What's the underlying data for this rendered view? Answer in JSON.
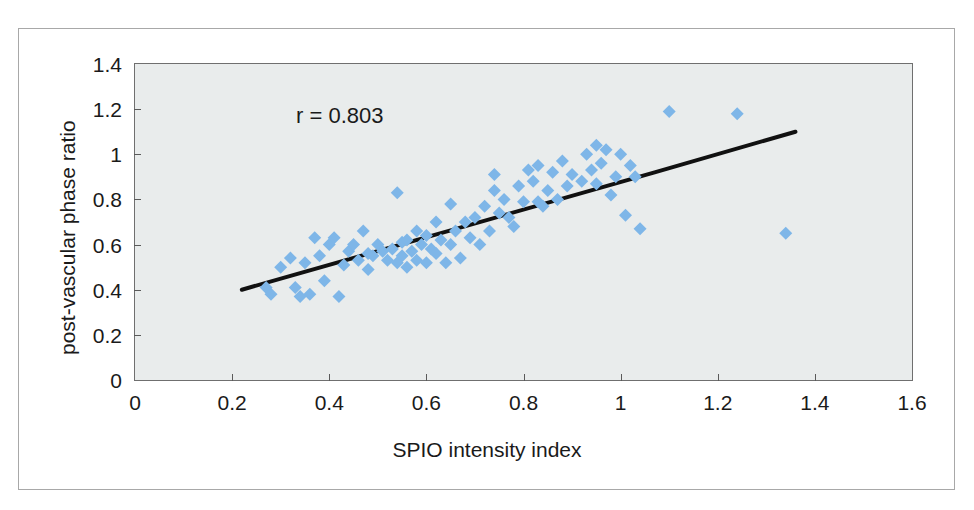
{
  "chart_data": {
    "type": "scatter",
    "title": "",
    "xlabel": "SPIO intensity index",
    "ylabel": "post-vascular phase ratio",
    "xlim": [
      0,
      1.6
    ],
    "ylim": [
      0,
      1.4
    ],
    "xticks": [
      "0",
      "0.2",
      "0.4",
      "0.6",
      "0.8",
      "1",
      "1.2",
      "1.4",
      "1.6"
    ],
    "xtick_values": [
      0,
      0.2,
      0.4,
      0.6,
      0.8,
      1.0,
      1.2,
      1.4,
      1.6
    ],
    "yticks": [
      "0",
      "0.2",
      "0.4",
      "0.6",
      "0.8",
      "1",
      "1.2",
      "1.4"
    ],
    "ytick_values": [
      0,
      0.2,
      0.4,
      0.6,
      0.8,
      1.0,
      1.2,
      1.4
    ],
    "grid": false,
    "legend": null,
    "annotations": [
      {
        "text": "r = 0.803",
        "x": 0.34,
        "y": 1.17
      }
    ],
    "marker": {
      "shape": "diamond",
      "color": "#7EB6E8",
      "size": 13
    },
    "series": [
      {
        "name": "samples",
        "points": [
          [
            0.27,
            0.41
          ],
          [
            0.28,
            0.38
          ],
          [
            0.3,
            0.5
          ],
          [
            0.32,
            0.54
          ],
          [
            0.33,
            0.41
          ],
          [
            0.34,
            0.37
          ],
          [
            0.35,
            0.52
          ],
          [
            0.36,
            0.38
          ],
          [
            0.37,
            0.63
          ],
          [
            0.38,
            0.55
          ],
          [
            0.39,
            0.44
          ],
          [
            0.4,
            0.6
          ],
          [
            0.41,
            0.63
          ],
          [
            0.42,
            0.37
          ],
          [
            0.43,
            0.51
          ],
          [
            0.44,
            0.57
          ],
          [
            0.45,
            0.6
          ],
          [
            0.46,
            0.53
          ],
          [
            0.47,
            0.66
          ],
          [
            0.48,
            0.49
          ],
          [
            0.48,
            0.56
          ],
          [
            0.49,
            0.55
          ],
          [
            0.5,
            0.6
          ],
          [
            0.51,
            0.57
          ],
          [
            0.52,
            0.53
          ],
          [
            0.53,
            0.58
          ],
          [
            0.54,
            0.52
          ],
          [
            0.54,
            0.83
          ],
          [
            0.55,
            0.61
          ],
          [
            0.55,
            0.55
          ],
          [
            0.56,
            0.5
          ],
          [
            0.56,
            0.62
          ],
          [
            0.57,
            0.57
          ],
          [
            0.58,
            0.66
          ],
          [
            0.58,
            0.53
          ],
          [
            0.59,
            0.6
          ],
          [
            0.6,
            0.64
          ],
          [
            0.6,
            0.52
          ],
          [
            0.61,
            0.58
          ],
          [
            0.62,
            0.7
          ],
          [
            0.62,
            0.56
          ],
          [
            0.63,
            0.62
          ],
          [
            0.64,
            0.52
          ],
          [
            0.65,
            0.78
          ],
          [
            0.65,
            0.6
          ],
          [
            0.66,
            0.66
          ],
          [
            0.67,
            0.54
          ],
          [
            0.68,
            0.7
          ],
          [
            0.69,
            0.63
          ],
          [
            0.7,
            0.72
          ],
          [
            0.71,
            0.6
          ],
          [
            0.72,
            0.77
          ],
          [
            0.73,
            0.66
          ],
          [
            0.74,
            0.91
          ],
          [
            0.74,
            0.84
          ],
          [
            0.75,
            0.74
          ],
          [
            0.76,
            0.8
          ],
          [
            0.77,
            0.72
          ],
          [
            0.78,
            0.68
          ],
          [
            0.79,
            0.86
          ],
          [
            0.8,
            0.79
          ],
          [
            0.81,
            0.93
          ],
          [
            0.82,
            0.88
          ],
          [
            0.83,
            0.95
          ],
          [
            0.83,
            0.79
          ],
          [
            0.84,
            0.77
          ],
          [
            0.85,
            0.84
          ],
          [
            0.86,
            0.92
          ],
          [
            0.87,
            0.8
          ],
          [
            0.88,
            0.97
          ],
          [
            0.89,
            0.86
          ],
          [
            0.9,
            0.91
          ],
          [
            0.92,
            0.88
          ],
          [
            0.93,
            1.0
          ],
          [
            0.94,
            0.93
          ],
          [
            0.95,
            1.04
          ],
          [
            0.95,
            0.87
          ],
          [
            0.96,
            0.96
          ],
          [
            0.97,
            1.02
          ],
          [
            0.98,
            0.82
          ],
          [
            0.99,
            0.9
          ],
          [
            1.0,
            1.0
          ],
          [
            1.01,
            0.73
          ],
          [
            1.02,
            0.95
          ],
          [
            1.03,
            0.9
          ],
          [
            1.04,
            0.67
          ],
          [
            1.1,
            1.19
          ],
          [
            1.24,
            1.18
          ],
          [
            1.34,
            0.65
          ]
        ]
      }
    ],
    "trendline": {
      "color": "#111111",
      "width": 4,
      "vertices": [
        [
          0.22,
          0.4
        ],
        [
          1.07,
          0.92
        ],
        [
          1.36,
          1.1
        ]
      ]
    }
  }
}
